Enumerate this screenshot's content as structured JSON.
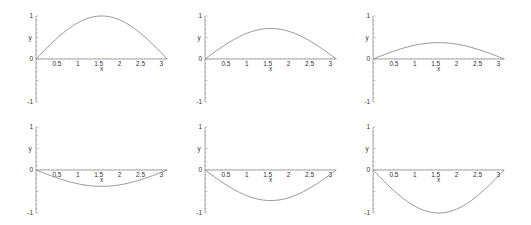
{
  "chart_data": [
    {
      "type": "line",
      "function": "y = 1.00*sin(x)",
      "amplitude": 1.0,
      "xlabel": "x",
      "ylabel": "y",
      "xlim": [
        0,
        3.1416
      ],
      "ylim": [
        -1,
        1
      ],
      "xticks": [
        "0.5",
        "1",
        "1.5",
        "2",
        "2.5",
        "3"
      ],
      "yticks": [
        "-1",
        "0",
        "1"
      ],
      "grid": false
    },
    {
      "type": "line",
      "function": "y = 0.71*sin(x)",
      "amplitude": 0.71,
      "xlabel": "x",
      "ylabel": "y",
      "xlim": [
        0,
        3.1416
      ],
      "ylim": [
        -1,
        1
      ],
      "xticks": [
        "0.5",
        "1",
        "1.5",
        "2",
        "2.5",
        "3"
      ],
      "yticks": [
        "-1",
        "0",
        "1"
      ],
      "grid": false
    },
    {
      "type": "line",
      "function": "y = 0.38*sin(x)",
      "amplitude": 0.38,
      "xlabel": "x",
      "ylabel": "y",
      "xlim": [
        0,
        3.1416
      ],
      "ylim": [
        -1,
        1
      ],
      "xticks": [
        "0.5",
        "1",
        "1.5",
        "2",
        "2.5",
        "3"
      ],
      "yticks": [
        "-1",
        "0",
        "1"
      ],
      "grid": false
    },
    {
      "type": "line",
      "function": "y = -0.38*sin(x)",
      "amplitude": -0.38,
      "xlabel": "x",
      "ylabel": "y",
      "xlim": [
        0,
        3.1416
      ],
      "ylim": [
        -1,
        1
      ],
      "xticks": [
        "0.5",
        "1",
        "1.5",
        "2",
        "2.5",
        "3"
      ],
      "yticks": [
        "-1",
        "0",
        "1"
      ],
      "grid": false
    },
    {
      "type": "line",
      "function": "y = -0.71*sin(x)",
      "amplitude": -0.71,
      "xlabel": "x",
      "ylabel": "y",
      "xlim": [
        0,
        3.1416
      ],
      "ylim": [
        -1,
        1
      ],
      "xticks": [
        "0.5",
        "1",
        "1.5",
        "2",
        "2.5",
        "3"
      ],
      "yticks": [
        "-1",
        "0",
        "1"
      ],
      "grid": false
    },
    {
      "type": "line",
      "function": "y = -1.00*sin(x)",
      "amplitude": -1.0,
      "xlabel": "x",
      "ylabel": "y",
      "xlim": [
        0,
        3.1416
      ],
      "ylim": [
        -1,
        1
      ],
      "xticks": [
        "0.5",
        "1",
        "1.5",
        "2",
        "2.5",
        "3"
      ],
      "yticks": [
        "-1",
        "0",
        "1"
      ],
      "grid": false
    }
  ],
  "layout": {
    "panels": [
      {
        "ox": 36,
        "oy": 59
      },
      {
        "ox": 205,
        "oy": 59
      },
      {
        "ox": 373,
        "oy": 59
      },
      {
        "ox": 36,
        "oy": 170
      },
      {
        "ox": 205,
        "oy": 170
      },
      {
        "ox": 373,
        "oy": 170
      }
    ],
    "xscale": 41.8,
    "yscale": 43,
    "xmax": 3.1416,
    "line_color": "#8a8a8a",
    "axis_color": "#8a8a8a",
    "text_color": "#333333"
  }
}
